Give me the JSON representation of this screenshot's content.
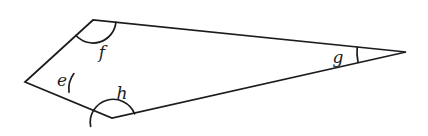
{
  "figure": {
    "type": "quadrilateral-angle-diagram",
    "background_color": "#ffffff",
    "stroke_color": "#1c1c20",
    "canvas": {
      "width": 428,
      "height": 136
    },
    "vertices": [
      {
        "name": "left",
        "label": "e",
        "x": 25,
        "y": 82
      },
      {
        "name": "top",
        "label": "f",
        "x": 93,
        "y": 20
      },
      {
        "name": "right",
        "label": "g",
        "x": 406,
        "y": 52
      },
      {
        "name": "bottom",
        "label": "h",
        "x": 112,
        "y": 118
      }
    ],
    "outline_path": "M 25 82 L 93 20 L 406 52 L 112 118 Z",
    "edges": [
      {
        "name": "edge-e-f",
        "from": "left",
        "to": "top"
      },
      {
        "name": "edge-f-g",
        "from": "top",
        "to": "right"
      },
      {
        "name": "edge-g-h",
        "from": "right",
        "to": "bottom"
      },
      {
        "name": "edge-h-e",
        "from": "bottom",
        "to": "left"
      }
    ],
    "angle_marks": [
      {
        "name": "angle-arc-e",
        "vertex": "left",
        "label": "e",
        "radius": 26,
        "arc_path": "M 44.0 10.2 A 26 26 0 0 1 48.9 -8.4"
      },
      {
        "name": "angle-arc-f",
        "vertex": "top",
        "label": "f",
        "radius": 23,
        "arc_path": "M -17.0 15.5 A 23 23 0 0 0 22.9 2.3"
      },
      {
        "name": "angle-arc-g",
        "vertex": "right",
        "label": "g",
        "radius": 49,
        "arc_path": "M -48.8 -5.0 A 49 49 0 0 0 -48.0 9.8"
      },
      {
        "name": "angle-arc-h",
        "vertex": "bottom",
        "label": "h",
        "radius": 23,
        "arc_path": "M -21.4 8.4 A 23 23 0 0 1 22.6 -4.2"
      }
    ],
    "labels": [
      {
        "name": "angle-label-e",
        "text": "e",
        "x": 62,
        "y": 80
      },
      {
        "name": "angle-label-f",
        "text": "f",
        "x": 102,
        "y": 52
      },
      {
        "name": "angle-label-g",
        "text": "g",
        "x": 338,
        "y": 57
      },
      {
        "name": "angle-label-h",
        "text": "h",
        "x": 122,
        "y": 93
      }
    ]
  }
}
